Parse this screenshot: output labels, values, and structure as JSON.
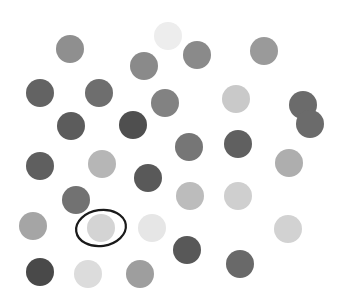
{
  "scene": {
    "name": "grayscale-dot-array",
    "width": 337,
    "height": 304,
    "background_color": "#ffffff",
    "description": "Scattered array of grayscale filled circles on a white field with one circle marked by a hand-drawn black ellipse annotation",
    "dot_count": 31,
    "dot_radius": 14
  },
  "annotation": {
    "type": "ellipse",
    "label": "target-highlight",
    "cx": 101,
    "cy": 228,
    "rx": 25,
    "ry": 18,
    "rotation": -8,
    "stroke_color": "#1a1a1a",
    "stroke_width": 2.2,
    "fill": "none",
    "target_dot_index": 22
  },
  "palette": {
    "lightest": "#ededed",
    "light": "#d6d6d6",
    "medium_light": "#bfbfbf",
    "medium": "#a3a3a3",
    "medium_dark": "#8a8a8a",
    "dark": "#6e6e6e",
    "darkest": "#4a4a4a"
  },
  "dots": [
    {
      "id": "dot-1",
      "cx": 70,
      "cy": 49,
      "r": 14,
      "color": "#8f8f8f"
    },
    {
      "id": "dot-2",
      "cx": 168,
      "cy": 36,
      "r": 14,
      "color": "#ededed"
    },
    {
      "id": "dot-3",
      "cx": 197,
      "cy": 55,
      "r": 14,
      "color": "#8a8a8a"
    },
    {
      "id": "dot-4",
      "cx": 264,
      "cy": 51,
      "r": 14,
      "color": "#9a9a9a"
    },
    {
      "id": "dot-5",
      "cx": 144,
      "cy": 66,
      "r": 14,
      "color": "#8a8a8a"
    },
    {
      "id": "dot-6",
      "cx": 40,
      "cy": 93,
      "r": 14,
      "color": "#636363"
    },
    {
      "id": "dot-7",
      "cx": 99,
      "cy": 93,
      "r": 14,
      "color": "#6e6e6e"
    },
    {
      "id": "dot-8",
      "cx": 165,
      "cy": 103,
      "r": 14,
      "color": "#828282"
    },
    {
      "id": "dot-9",
      "cx": 236,
      "cy": 99,
      "r": 14,
      "color": "#c9c9c9"
    },
    {
      "id": "dot-10",
      "cx": 303,
      "cy": 105,
      "r": 14,
      "color": "#6b6b6b"
    },
    {
      "id": "dot-11",
      "cx": 71,
      "cy": 126,
      "r": 14,
      "color": "#5c5c5c"
    },
    {
      "id": "dot-12",
      "cx": 133,
      "cy": 125,
      "r": 14,
      "color": "#4f4f4f"
    },
    {
      "id": "dot-13",
      "cx": 189,
      "cy": 147,
      "r": 14,
      "color": "#767676"
    },
    {
      "id": "dot-14",
      "cx": 238,
      "cy": 144,
      "r": 14,
      "color": "#606060"
    },
    {
      "id": "dot-15",
      "cx": 40,
      "cy": 166,
      "r": 14,
      "color": "#5f5f5f"
    },
    {
      "id": "dot-16",
      "cx": 102,
      "cy": 164,
      "r": 14,
      "color": "#b6b6b6"
    },
    {
      "id": "dot-17",
      "cx": 289,
      "cy": 163,
      "r": 14,
      "color": "#aeaeae"
    },
    {
      "id": "dot-18",
      "cx": 148,
      "cy": 178,
      "r": 14,
      "color": "#595959"
    },
    {
      "id": "dot-19",
      "cx": 190,
      "cy": 196,
      "r": 14,
      "color": "#bcbcbc"
    },
    {
      "id": "dot-20",
      "cx": 238,
      "cy": 196,
      "r": 14,
      "color": "#cfcfcf"
    },
    {
      "id": "dot-21",
      "cx": 76,
      "cy": 200,
      "r": 14,
      "color": "#727272"
    },
    {
      "id": "dot-22",
      "cx": 33,
      "cy": 226,
      "r": 14,
      "color": "#a5a5a5"
    },
    {
      "id": "dot-23",
      "cx": 101,
      "cy": 228,
      "r": 14,
      "color": "#d4d4d4"
    },
    {
      "id": "dot-24",
      "cx": 152,
      "cy": 228,
      "r": 14,
      "color": "#e6e6e6"
    },
    {
      "id": "dot-25",
      "cx": 288,
      "cy": 229,
      "r": 14,
      "color": "#d2d2d2"
    },
    {
      "id": "dot-26",
      "cx": 187,
      "cy": 250,
      "r": 14,
      "color": "#585858"
    },
    {
      "id": "dot-27",
      "cx": 240,
      "cy": 264,
      "r": 14,
      "color": "#696969"
    },
    {
      "id": "dot-28",
      "cx": 40,
      "cy": 272,
      "r": 14,
      "color": "#494949"
    },
    {
      "id": "dot-29",
      "cx": 88,
      "cy": 274,
      "r": 14,
      "color": "#dcdcdc"
    },
    {
      "id": "dot-30",
      "cx": 140,
      "cy": 274,
      "r": 14,
      "color": "#9e9e9e"
    },
    {
      "id": "dot-31",
      "cx": 310,
      "cy": 124,
      "r": 14,
      "color": "#6b6b6b"
    }
  ]
}
